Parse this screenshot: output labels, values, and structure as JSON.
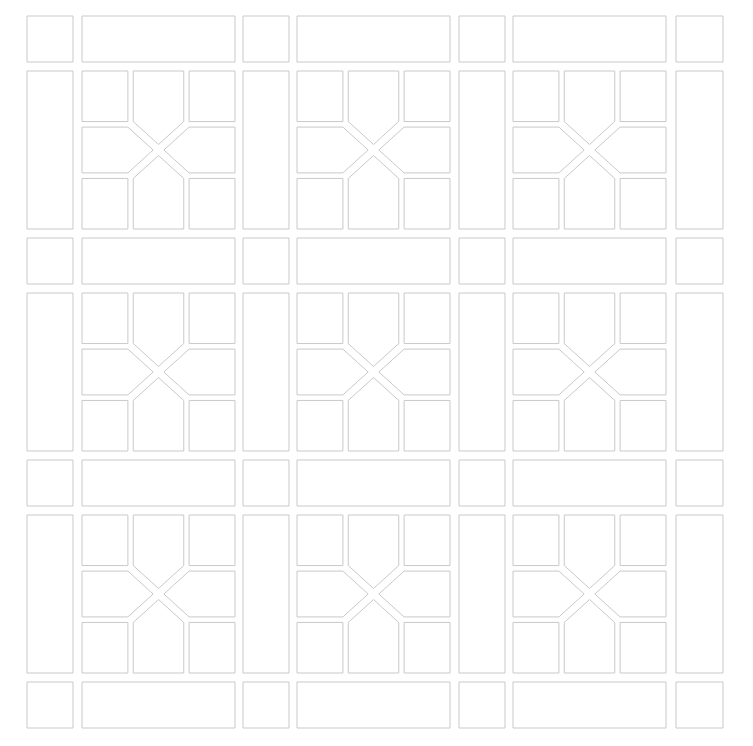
{
  "panel": {
    "title": "Decorative Lattice Screen Panel",
    "width": 753,
    "height": 746,
    "background_color": "#ffffff",
    "stroke_color": "#c9c9cc",
    "tile_fill_color": "#ffffff",
    "stroke_width": 1,
    "description": "Symmetric architectural grille pattern: a 7x7 meta-grid of alternating narrow band tracks and wide motif tracks. Each wide-by-wide intersection holds an X motif of four corner squares and four inward-pointing pentagons."
  },
  "grid": {
    "track_kinds": [
      "band",
      "motif",
      "band",
      "motif",
      "band",
      "motif",
      "band"
    ],
    "columns": [
      {
        "index": 0,
        "kind": "band",
        "start": 27,
        "end": 73
      },
      {
        "index": 1,
        "kind": "motif",
        "start": 82,
        "end": 235
      },
      {
        "index": 2,
        "kind": "band",
        "start": 243,
        "end": 289
      },
      {
        "index": 3,
        "kind": "motif",
        "start": 297,
        "end": 450
      },
      {
        "index": 4,
        "kind": "band",
        "start": 459,
        "end": 505
      },
      {
        "index": 5,
        "kind": "motif",
        "start": 513,
        "end": 666
      },
      {
        "index": 6,
        "kind": "band",
        "start": 676,
        "end": 723
      }
    ],
    "rows": [
      {
        "index": 0,
        "kind": "band",
        "start": 16,
        "end": 62
      },
      {
        "index": 1,
        "kind": "motif",
        "start": 71,
        "end": 229
      },
      {
        "index": 2,
        "kind": "band",
        "start": 238,
        "end": 284
      },
      {
        "index": 3,
        "kind": "motif",
        "start": 293,
        "end": 451
      },
      {
        "index": 4,
        "kind": "band",
        "start": 460,
        "end": 506
      },
      {
        "index": 5,
        "kind": "motif",
        "start": 515,
        "end": 673
      },
      {
        "index": 6,
        "kind": "band",
        "start": 682,
        "end": 728
      }
    ]
  },
  "motif": {
    "name": "x-cross-motif",
    "cell_count": 8,
    "corner_square_size": 46,
    "inner_gap": 7,
    "sub_splits_x": [
      0.0,
      0.3,
      0.335,
      0.665,
      0.7,
      1.0
    ],
    "sub_splits_y": [
      0.0,
      0.32,
      0.355,
      0.645,
      0.68,
      1.0
    ],
    "parts": [
      {
        "name": "corner-square-top-left",
        "shape": "square"
      },
      {
        "name": "pentagon-top",
        "shape": "pentagon",
        "points_toward": "center"
      },
      {
        "name": "corner-square-top-right",
        "shape": "square"
      },
      {
        "name": "pentagon-left",
        "shape": "pentagon",
        "points_toward": "center"
      },
      {
        "name": "pentagon-right",
        "shape": "pentagon",
        "points_toward": "center"
      },
      {
        "name": "corner-square-bottom-left",
        "shape": "square"
      },
      {
        "name": "pentagon-bottom",
        "shape": "pentagon",
        "points_toward": "center"
      },
      {
        "name": "corner-square-bottom-right",
        "shape": "square"
      }
    ]
  },
  "legend": {
    "band_band_tile": "small-square-tile",
    "band_motif_tile": "wide-bar-tile",
    "motif_band_tile": "tall-bar-tile",
    "motif_motif_tile": "x-cross-motif"
  }
}
